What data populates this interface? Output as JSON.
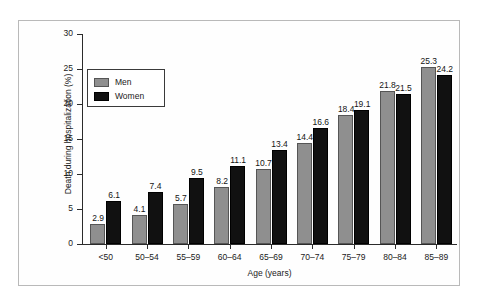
{
  "chart_data": {
    "type": "bar",
    "title": "",
    "xlabel": "Age (years)",
    "ylabel": "Death during hospitalization (%)",
    "ylim": [
      0,
      30
    ],
    "yticks": [
      0,
      5,
      10,
      15,
      20,
      25,
      30
    ],
    "grid": false,
    "legend_position": "upper-left-inside",
    "categories": [
      "<50",
      "50–54",
      "55–59",
      "60–64",
      "65–69",
      "70–74",
      "75–79",
      "80–84",
      "85–89"
    ],
    "series": [
      {
        "name": "Men",
        "color": "#8f8f8f",
        "values": [
          2.9,
          4.1,
          5.7,
          8.2,
          10.7,
          14.4,
          18.4,
          21.8,
          25.3
        ],
        "labels": [
          "2.9",
          "4.1",
          "5.7",
          "8.2",
          "10.7",
          "14.4",
          "18.4",
          "21.8",
          "25.3"
        ]
      },
      {
        "name": "Women",
        "color": "#111111",
        "values": [
          6.1,
          7.4,
          9.5,
          11.1,
          13.4,
          16.6,
          19.1,
          21.5,
          24.2
        ],
        "labels": [
          "6.1",
          "7.4",
          "9.5",
          "11.1",
          "13.4",
          "16.6",
          "19.1",
          "21.5",
          "24.2"
        ]
      }
    ],
    "ytick_labels": [
      "0",
      "5",
      "10",
      "15",
      "20",
      "25",
      "30"
    ]
  },
  "legend": {
    "items": [
      {
        "label": "Men",
        "color": "#8f8f8f"
      },
      {
        "label": "Women",
        "color": "#111111"
      }
    ]
  }
}
